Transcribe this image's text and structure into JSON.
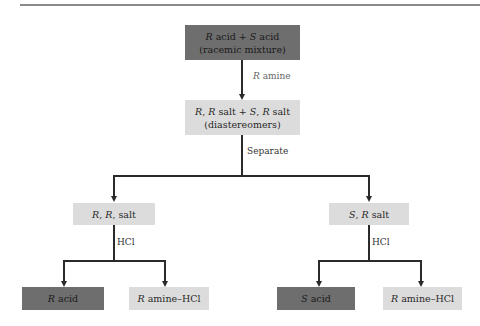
{
  "diagram": {
    "title": "",
    "top_box": {
      "line1": "R acid + S acid",
      "line2": "(racemic mixture)"
    },
    "step1_label": "R amine",
    "middle_box": {
      "line1": "R, R salt + S, R salt",
      "line2": "(diastereomers)"
    },
    "step2_label": "Separate",
    "left_salt": "R, R, salt",
    "right_salt": "S, R salt",
    "left_step_label": "HCl",
    "right_step_label": "HCl",
    "left_products": [
      "R acid",
      "R amine–HCl"
    ],
    "right_products": [
      "S acid",
      "R amine–HCl"
    ],
    "colors": {
      "dark_box": "#6e6e6e",
      "light_box": "#dcdcdc",
      "line": "#2a2a2a"
    }
  }
}
